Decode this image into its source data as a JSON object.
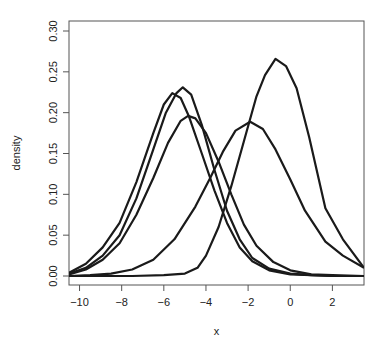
{
  "chart_data": {
    "type": "line",
    "title": "",
    "xlabel": "x",
    "ylabel": "density",
    "xlim": [
      -10.5,
      3.5
    ],
    "ylim": [
      0,
      0.3
    ],
    "x_ticks": [
      -10,
      -8,
      -6,
      -4,
      -2,
      0,
      2
    ],
    "x_tick_labels": [
      "−10",
      "−8",
      "−6",
      "−4",
      "−2",
      "0",
      "2"
    ],
    "y_ticks": [
      0,
      0.05,
      0.1,
      0.15,
      0.2,
      0.25,
      0.3
    ],
    "y_tick_labels": [
      "0.00",
      "0.05",
      "0.10",
      "0.15",
      "0.20",
      "0.25",
      "0.30"
    ],
    "grid": false,
    "legend": "none",
    "line_color": "#1a1a1a",
    "series": [
      {
        "name": "curve-1",
        "x": [
          -10.5,
          -9.7,
          -8.9,
          -8.1,
          -7.3,
          -6.5,
          -6.0,
          -5.6,
          -5.2,
          -4.8,
          -4.2,
          -3.6,
          -3.0,
          -2.4,
          -1.8,
          -1.0,
          0.0,
          1.0,
          2.0,
          3.5
        ],
        "y": [
          0.004,
          0.015,
          0.035,
          0.065,
          0.115,
          0.175,
          0.21,
          0.224,
          0.218,
          0.195,
          0.15,
          0.105,
          0.065,
          0.035,
          0.018,
          0.007,
          0.002,
          0.001,
          0.0,
          0.0
        ]
      },
      {
        "name": "curve-2",
        "x": [
          -10.5,
          -9.7,
          -8.9,
          -8.1,
          -7.3,
          -6.5,
          -5.9,
          -5.4,
          -5.1,
          -4.7,
          -4.2,
          -3.6,
          -3.0,
          -2.4,
          -1.8,
          -1.0,
          0.0,
          1.0,
          2.0,
          3.5
        ],
        "y": [
          0.003,
          0.01,
          0.025,
          0.05,
          0.095,
          0.155,
          0.2,
          0.224,
          0.231,
          0.222,
          0.185,
          0.13,
          0.08,
          0.045,
          0.022,
          0.009,
          0.003,
          0.001,
          0.0,
          0.0
        ]
      },
      {
        "name": "curve-3",
        "x": [
          -10.5,
          -9.7,
          -8.9,
          -8.1,
          -7.3,
          -6.5,
          -5.8,
          -5.2,
          -4.85,
          -4.5,
          -4.0,
          -3.4,
          -2.8,
          -2.2,
          -1.6,
          -0.8,
          0.0,
          1.0,
          2.0,
          3.5
        ],
        "y": [
          0.002,
          0.008,
          0.02,
          0.04,
          0.075,
          0.12,
          0.163,
          0.19,
          0.196,
          0.193,
          0.175,
          0.14,
          0.1,
          0.063,
          0.037,
          0.017,
          0.007,
          0.002,
          0.001,
          0.0
        ]
      },
      {
        "name": "curve-4",
        "x": [
          -10.5,
          -9.5,
          -8.5,
          -7.5,
          -6.5,
          -5.5,
          -4.5,
          -3.8,
          -3.2,
          -2.6,
          -1.9,
          -1.3,
          -0.7,
          0.0,
          0.7,
          1.67,
          2.5,
          3.5
        ],
        "y": [
          0.0,
          0.001,
          0.003,
          0.008,
          0.02,
          0.045,
          0.085,
          0.12,
          0.152,
          0.178,
          0.189,
          0.18,
          0.155,
          0.118,
          0.08,
          0.042,
          0.025,
          0.01
        ]
      },
      {
        "name": "curve-5",
        "x": [
          -10.5,
          -9.0,
          -7.5,
          -6.0,
          -5.0,
          -4.4,
          -4.0,
          -3.4,
          -2.8,
          -2.2,
          -1.6,
          -1.2,
          -0.7,
          -0.2,
          0.3,
          0.9,
          1.67,
          2.5,
          3.5
        ],
        "y": [
          0.0,
          0.0,
          0.0,
          0.001,
          0.003,
          0.01,
          0.025,
          0.06,
          0.11,
          0.165,
          0.22,
          0.246,
          0.266,
          0.257,
          0.23,
          0.17,
          0.083,
          0.045,
          0.01
        ]
      }
    ]
  }
}
